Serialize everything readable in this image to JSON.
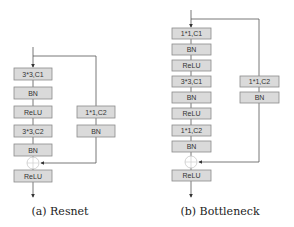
{
  "diagrams": [
    {
      "caption": "(a) Resnet",
      "main_path": [
        "3*3,C1",
        "BN",
        "ReLU",
        "3*3,C2",
        "BN"
      ],
      "shortcut": [
        "1*1,C2",
        "BN"
      ],
      "output": "ReLU"
    },
    {
      "caption": "(b) Bottleneck",
      "main_path": [
        "1*1,C1",
        "BN",
        "ReLU",
        "3*3,C1",
        "BN",
        "ReLU",
        "1*1,C2",
        "BN"
      ],
      "shortcut": [
        "1*1,C2",
        "BN"
      ],
      "output": "ReLU"
    }
  ],
  "colors": {
    "box_fill": "#dadada",
    "box_stroke": "#8a8a8a",
    "line": "#555555"
  }
}
